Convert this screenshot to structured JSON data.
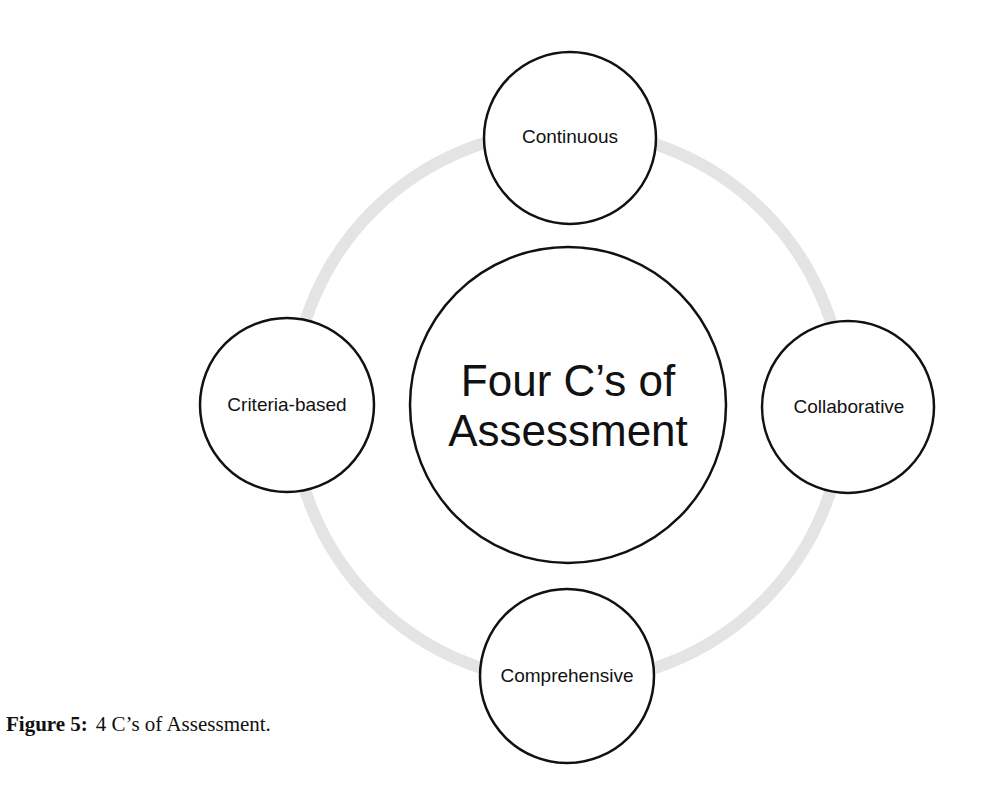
{
  "diagram": {
    "center": {
      "line1": "Four C’s of",
      "line2": "Assessment"
    },
    "nodes": [
      {
        "id": "top",
        "label": "Continuous"
      },
      {
        "id": "right",
        "label": "Collaborative"
      },
      {
        "id": "bottom",
        "label": "Comprehensive"
      },
      {
        "id": "left",
        "label": "Criteria-based"
      }
    ],
    "colors": {
      "ring": "#e4e4e4",
      "stroke": "#111111",
      "fill": "#ffffff"
    }
  },
  "caption": {
    "label": "Figure 5:",
    "text": "4 C’s of Assessment."
  }
}
